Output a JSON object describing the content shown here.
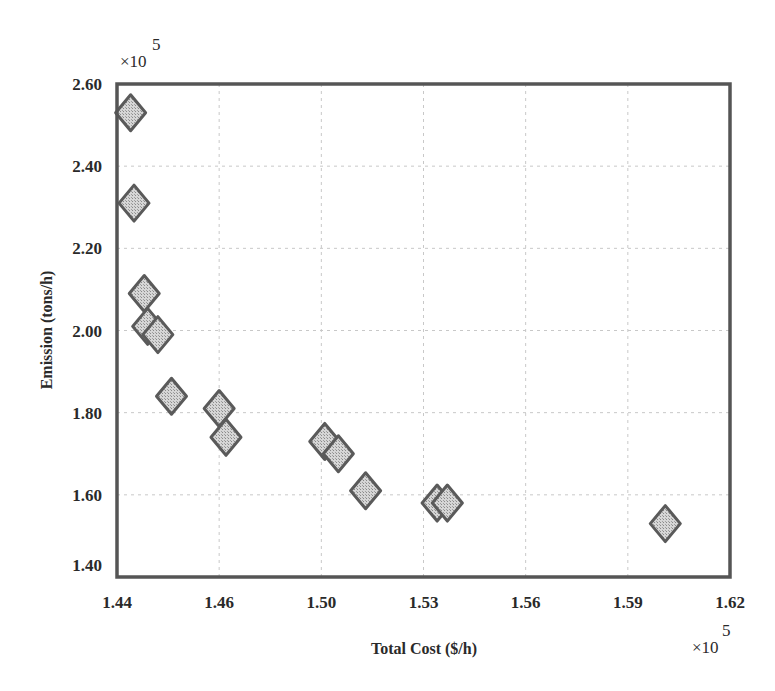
{
  "chart_data": {
    "type": "scatter",
    "title": "",
    "xlabel": "Total Cost ($/h)",
    "ylabel": "Emission (tons/h)",
    "x_multiplier_label": "×10",
    "x_multiplier_exponent": "5",
    "y_multiplier_label": "×10",
    "y_multiplier_exponent": "5",
    "xlim": [
      1.44,
      1.62
    ],
    "ylim": [
      1.4,
      2.6
    ],
    "x_ticks": [
      1.44,
      1.47,
      1.5,
      1.53,
      1.56,
      1.59,
      1.62
    ],
    "x_tick_labels": [
      "1.44",
      "1.46",
      "1.50",
      "1.53",
      "1.56",
      "1.59",
      "1.62"
    ],
    "y_ticks": [
      1.4,
      1.6,
      1.8,
      2.0,
      2.2,
      2.4,
      2.6
    ],
    "y_tick_labels": [
      "1.40",
      "1.60",
      "1.80",
      "2.00",
      "2.20",
      "2.40",
      "2.60"
    ],
    "grid": true,
    "legend": null,
    "marker": "diamond",
    "marker_fill": "#c9c9c9",
    "marker_edge": "#5a5a5a",
    "series": [
      {
        "name": "Pareto front",
        "points": [
          {
            "x": 1.444,
            "y": 2.53
          },
          {
            "x": 1.445,
            "y": 2.31
          },
          {
            "x": 1.448,
            "y": 2.09
          },
          {
            "x": 1.449,
            "y": 2.01
          },
          {
            "x": 1.452,
            "y": 1.99
          },
          {
            "x": 1.456,
            "y": 1.84
          },
          {
            "x": 1.47,
            "y": 1.81
          },
          {
            "x": 1.472,
            "y": 1.74
          },
          {
            "x": 1.501,
            "y": 1.73
          },
          {
            "x": 1.505,
            "y": 1.7
          },
          {
            "x": 1.513,
            "y": 1.61
          },
          {
            "x": 1.534,
            "y": 1.58
          },
          {
            "x": 1.537,
            "y": 1.58
          },
          {
            "x": 1.601,
            "y": 1.53
          }
        ]
      }
    ]
  }
}
